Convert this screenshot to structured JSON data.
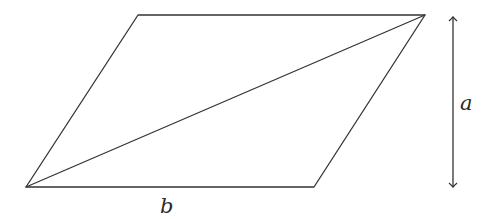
{
  "diagram": {
    "shape": "parallelogram",
    "stroke_color": "#333333",
    "vertices": {
      "bottom_left": [
        26,
        187
      ],
      "top_left": [
        138,
        15
      ],
      "top_right": [
        425,
        15
      ],
      "bottom_right": [
        314,
        187
      ]
    },
    "diagonal": {
      "from": "bottom_left",
      "to": "top_right"
    },
    "height_arrow": {
      "x": 453,
      "y_top": 16,
      "y_bottom": 188,
      "double_headed": true
    },
    "labels": {
      "height": "a",
      "base": "b"
    }
  }
}
